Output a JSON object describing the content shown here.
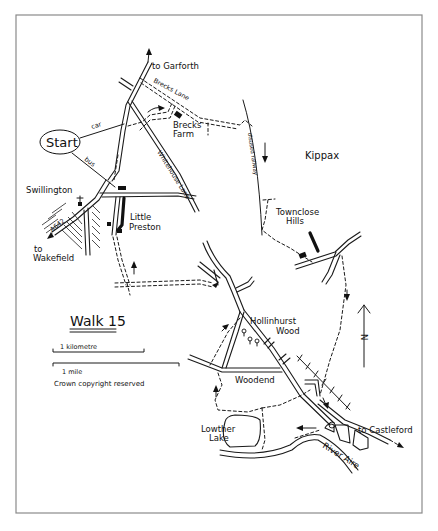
{
  "title": "Walk 15",
  "start_label": "Start",
  "route_labels": {
    "car": "car",
    "bus": "bus"
  },
  "places": {
    "garforth": "to Garforth",
    "brecks_lane": "Brecks Lane",
    "brecks_farm_line1": "Brecks",
    "brecks_farm_line2": "Farm",
    "kippax": "Kippax",
    "disused_railway": "disused railway",
    "whitehouse_lane": "Whitehouse Lane",
    "swillington": "Swillington",
    "a642": "A642",
    "wakefield_line1": "to",
    "wakefield_line2": "Wakefield",
    "little_preston_line1": "Little",
    "little_preston_line2": "Preston",
    "townclose_line1": "Townclose",
    "townclose_line2": "Hills",
    "hollinhurst_line1": "Hollinhurst",
    "hollinhurst_line2": "Wood",
    "woodend": "Woodend",
    "lowther_line1": "Lowther",
    "lowther_line2": "Lake",
    "castleford": "to Castleford",
    "river_aire": "River Aire"
  },
  "legend": {
    "scale_km": "1 kilometre",
    "scale_mile": "1 mile",
    "copyright": "Crown copyright reserved",
    "north": "N"
  },
  "colors": {
    "ink": "#111111",
    "frame": "#8a8a8a",
    "paper": "#ffffff"
  }
}
